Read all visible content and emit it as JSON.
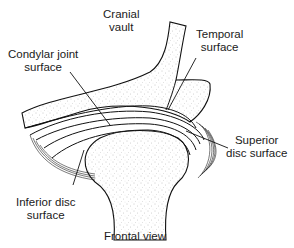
{
  "diagram": {
    "caption": "Frontal view",
    "labels": {
      "cranial_vault": [
        "Cranial",
        "vault"
      ],
      "temporal_surface": [
        "Temporal",
        "surface"
      ],
      "condylar_joint_surface": [
        "Condylar joint",
        "surface"
      ],
      "superior_disc_surface": [
        "Superior",
        "disc surface"
      ],
      "inferior_disc_surface": [
        "Inferior disc",
        "surface"
      ]
    },
    "colors": {
      "line": "#111111",
      "stipple": "#8a8a8a",
      "background": "#ffffff"
    }
  }
}
